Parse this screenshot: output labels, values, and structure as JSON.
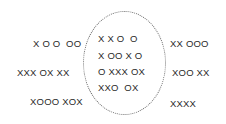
{
  "diagram": {
    "type": "set-membership",
    "boundary": {
      "shape": "ellipse",
      "style": "dotted",
      "color": "#6a6a6a"
    },
    "outside_left": [
      "X O O  OO",
      "XXX OX XX",
      "XOOO XOX"
    ],
    "inside": [
      "X X O  O",
      "X OO X O",
      "O XXX OX",
      "XXO  OX"
    ],
    "outside_right": [
      "XX OOO",
      "XOO XX",
      "XXXX"
    ]
  }
}
